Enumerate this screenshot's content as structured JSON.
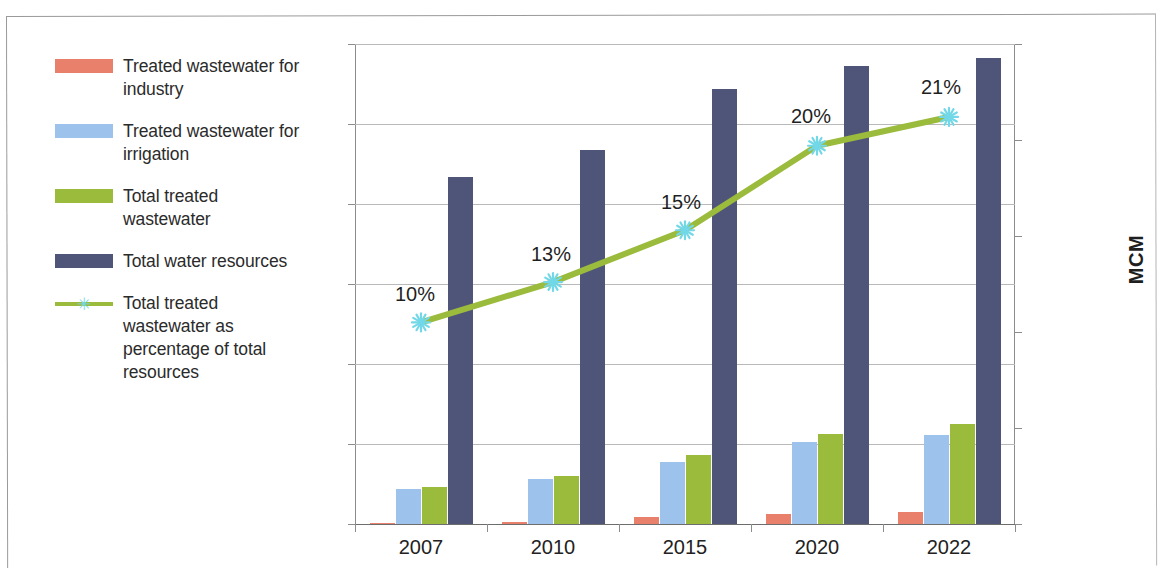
{
  "axis_title_right": "MCM",
  "legend": {
    "items": [
      {
        "label": "Treated wastewater for industry",
        "type": "swatch",
        "color": "#e8806b",
        "icon": "square-swatch-icon"
      },
      {
        "label": "Treated wastewater for irrigation",
        "type": "swatch",
        "color": "#9dc3ec",
        "icon": "square-swatch-icon"
      },
      {
        "label": "Total treated wastewater",
        "type": "swatch",
        "color": "#9bbb3c",
        "icon": "square-swatch-icon"
      },
      {
        "label": "Total water resources",
        "type": "swatch",
        "color": "#4f5578",
        "icon": "square-swatch-icon"
      },
      {
        "label": "Total treated wastewater as percentage of total resources",
        "type": "line",
        "color": "#9bbb3c",
        "marker_color": "#72d8e8",
        "icon": "line-marker-icon"
      }
    ]
  },
  "chart_data": {
    "type": "bar",
    "title": "",
    "xlabel": "",
    "ylabel": "MCM",
    "categories": [
      "2007",
      "2010",
      "2015",
      "2020",
      "2022"
    ],
    "ylim": [
      0,
      1200
    ],
    "yticks": [
      0,
      200,
      400,
      600,
      800,
      1000,
      1200
    ],
    "ytick_labels": [
      "0",
      "200",
      "400",
      "600",
      "800",
      "1000",
      "1200"
    ],
    "y2lim": [
      0,
      25
    ],
    "y2ticks": [
      0,
      5,
      10,
      15,
      20,
      25
    ],
    "y2tick_labels": [
      "0%",
      "5%",
      "10%",
      "15%",
      "20%",
      "25%"
    ],
    "grid": true,
    "legend_position": "left",
    "series": [
      {
        "name": "Treated wastewater for industry",
        "type": "bar",
        "axis": "left",
        "color": "#e8806b",
        "values": [
          2,
          6,
          17,
          25,
          30
        ]
      },
      {
        "name": "Treated wastewater for irrigation",
        "type": "bar",
        "axis": "left",
        "color": "#9dc3ec",
        "values": [
          88,
          112,
          155,
          205,
          222
        ]
      },
      {
        "name": "Total treated wastewater",
        "type": "bar",
        "axis": "left",
        "color": "#9bbb3c",
        "values": [
          93,
          120,
          172,
          225,
          250
        ]
      },
      {
        "name": "Total water resources",
        "type": "bar",
        "axis": "left",
        "color": "#4f5578",
        "values": [
          868,
          935,
          1088,
          1145,
          1165
        ]
      },
      {
        "name": "Total treated wastewater as percentage of total resources",
        "type": "line",
        "axis": "right",
        "color": "#9bbb3c",
        "marker_color": "#72d8e8",
        "values": [
          10.5,
          12.6,
          15.3,
          19.7,
          21.2
        ],
        "data_labels": [
          "10%",
          "13%",
          "15%",
          "20%",
          "21%"
        ]
      }
    ]
  }
}
